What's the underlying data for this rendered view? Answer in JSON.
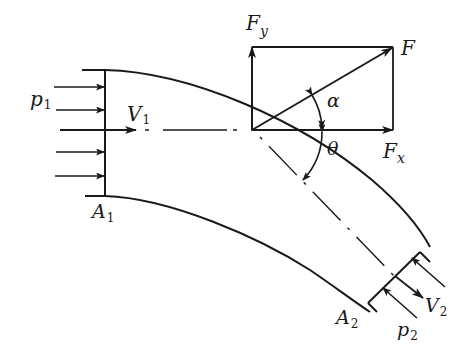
{
  "diagram": {
    "type": "fluid-mechanics bent pipe force diagram",
    "labels": {
      "p1": {
        "main": "p",
        "sub": "1"
      },
      "V1": {
        "main": "V",
        "sub": "1"
      },
      "A1": {
        "main": "A",
        "sub": "1"
      },
      "A2": {
        "main": "A",
        "sub": "2"
      },
      "V2": {
        "main": "V",
        "sub": "2"
      },
      "p2": {
        "main": "p",
        "sub": "2"
      },
      "F": {
        "main": "F"
      },
      "Fy": {
        "main": "F",
        "sub": "y"
      },
      "Fx": {
        "main": "F",
        "sub": "x"
      },
      "alpha": {
        "main": "α"
      },
      "theta": {
        "main": "θ"
      }
    },
    "colors": {
      "stroke": "#1a1a1a",
      "background": "#ffffff"
    }
  }
}
